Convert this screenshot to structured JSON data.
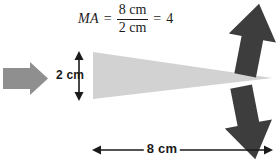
{
  "diagram": {
    "equation": {
      "lhs": "MA",
      "equals_1": "=",
      "numerator": "8 cm",
      "denominator": "2 cm",
      "equals_2": "=",
      "result": "4"
    },
    "labels": {
      "height": "2 cm",
      "length": "8 cm"
    },
    "shapes": {
      "wedge": "light-gray-triangle-wedge",
      "input_arrow": "gray-right-arrow",
      "output_arrow_up": "dark-up-arrow",
      "output_arrow_down": "dark-down-arrow",
      "height_dimension": "vertical-double-headed-arrow",
      "length_dimension": "horizontal-double-headed-arrow"
    },
    "colors": {
      "wedge_fill": "#d2d2d2",
      "input_arrow_fill": "#8f8f8f",
      "output_arrow_fill": "#3d3d3d",
      "dimension_stroke": "#1a1a1a",
      "text": "#1a1a1a",
      "background": "#ffffff"
    }
  }
}
